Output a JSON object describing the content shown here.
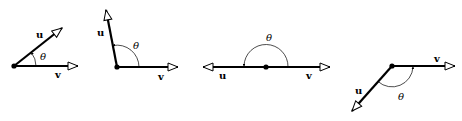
{
  "figure": {
    "stroke_color": "#000000",
    "background": "#ffffff",
    "panels": [
      {
        "id": "acute",
        "labels": {
          "u": "u",
          "v": "v",
          "theta": "θ"
        }
      },
      {
        "id": "obtuse-near-right",
        "labels": {
          "u": "u",
          "v": "v",
          "theta": "θ"
        }
      },
      {
        "id": "straight",
        "labels": {
          "u": "u",
          "v": "v",
          "theta": "θ"
        }
      },
      {
        "id": "obtuse-below",
        "labels": {
          "u": "u",
          "v": "v",
          "theta": "θ"
        }
      }
    ]
  }
}
